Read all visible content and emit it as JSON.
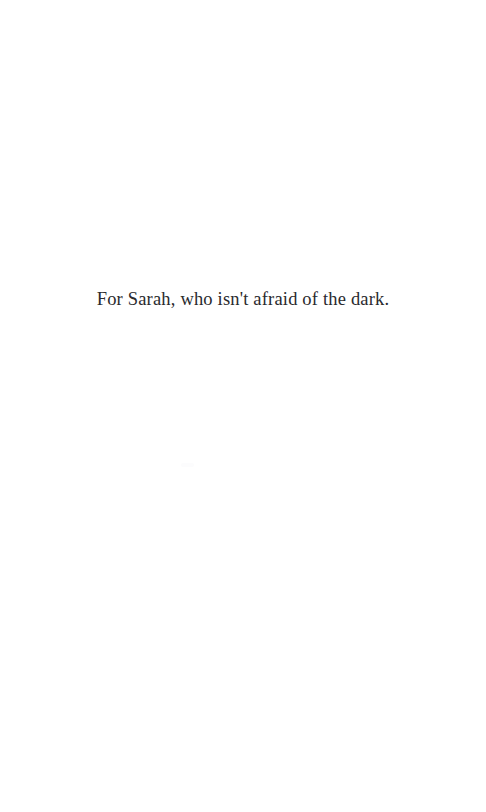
{
  "page": {
    "width": 486,
    "height": 812,
    "background_color": "#ffffff",
    "kind": "book-dedication-page"
  },
  "dedication": {
    "text": "For Sarah, who isn't afraid of the dark.",
    "text_color": "#2a2a2e",
    "alignment": "center"
  }
}
